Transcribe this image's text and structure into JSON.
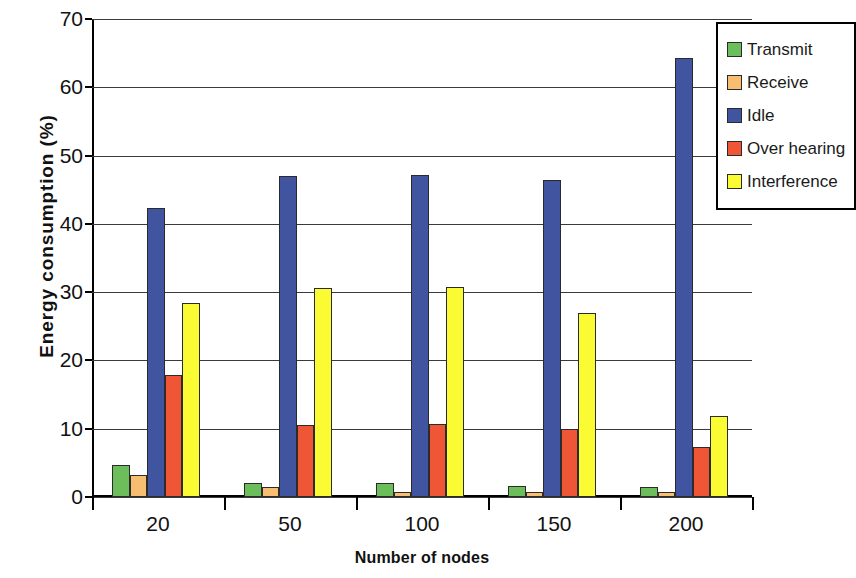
{
  "chart_data": {
    "type": "bar",
    "title": "",
    "xlabel": "Number of nodes",
    "ylabel": "Energy consumption (%)",
    "categories": [
      "20",
      "50",
      "100",
      "150",
      "200"
    ],
    "series": [
      {
        "name": "Transmit",
        "color": "#6CBE5A",
        "values": [
          4.7,
          2.0,
          2.0,
          1.6,
          1.5
        ]
      },
      {
        "name": "Receive",
        "color": "#F7BD70",
        "values": [
          3.2,
          1.4,
          0.7,
          0.7,
          0.7
        ]
      },
      {
        "name": "Idle",
        "color": "#41549F",
        "values": [
          42.3,
          47.0,
          47.1,
          46.4,
          64.3
        ]
      },
      {
        "name": "Over hearing",
        "color": "#EF5635",
        "values": [
          17.8,
          10.5,
          10.7,
          10.0,
          7.3
        ]
      },
      {
        "name": "Interference",
        "color": "#FBFB33",
        "values": [
          28.4,
          30.6,
          30.7,
          27.0,
          11.9
        ]
      }
    ],
    "ylim": [
      0,
      70
    ],
    "yticks": [
      0,
      10,
      20,
      30,
      40,
      50,
      60,
      70
    ],
    "ytick_labels": [
      "0",
      "10",
      "20",
      "30",
      "40",
      "50",
      "60",
      "70"
    ],
    "grid": true,
    "legend_position": "top-right",
    "legend_entries": [
      "Transmit",
      "Receive",
      "Idle",
      "Over hearing",
      "Interference"
    ]
  }
}
